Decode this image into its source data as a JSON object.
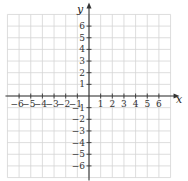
{
  "chart_data": {
    "type": "scatter",
    "title": "",
    "xlabel": "x",
    "ylabel": "y",
    "xlim": [
      -7,
      7
    ],
    "ylim": [
      -7,
      7
    ],
    "grid": true,
    "x_ticks": [
      -6,
      -5,
      -4,
      -3,
      -2,
      -1,
      1,
      2,
      3,
      4,
      5,
      6
    ],
    "y_ticks": [
      -6,
      -5,
      -4,
      -3,
      -2,
      -1,
      1,
      2,
      3,
      4,
      5,
      6
    ],
    "x_tick_labels": [
      "−6",
      "−5",
      "−4",
      "−3",
      "−2",
      "−1",
      "1",
      "2",
      "3",
      "4",
      "5",
      "6"
    ],
    "y_tick_labels": [
      "−6",
      "−5",
      "−4",
      "−3",
      "−2",
      "−1",
      "1",
      "2",
      "3",
      "4",
      "5",
      "6"
    ],
    "series": [],
    "legend": null
  },
  "colors": {
    "grid": "#d4d4d4",
    "axis": "#333333",
    "text": "#333333"
  }
}
